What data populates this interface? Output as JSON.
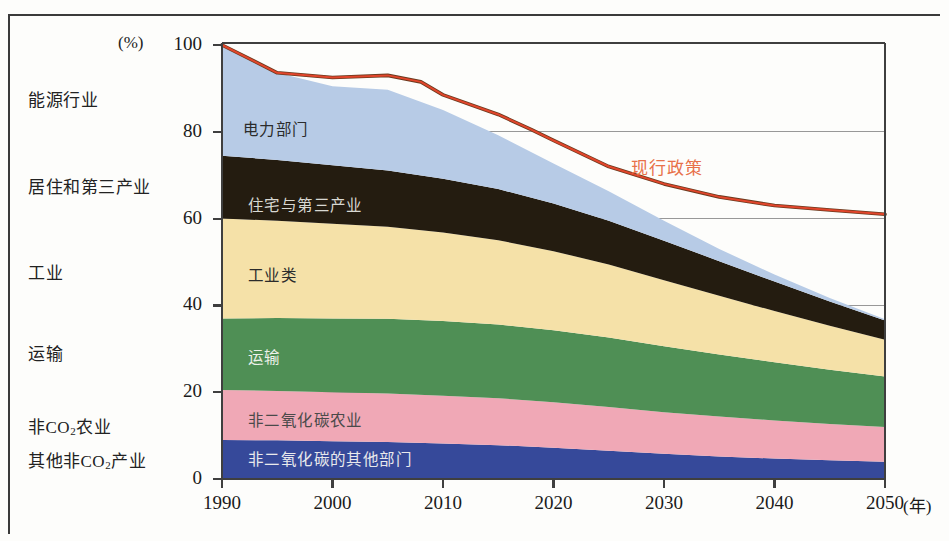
{
  "axis": {
    "y_unit": "(%)",
    "y_ticks": [
      0,
      20,
      40,
      60,
      80,
      100
    ],
    "x_ticks": [
      1990,
      2000,
      2010,
      2020,
      2030,
      2040,
      2050
    ],
    "x_unit": "(年)"
  },
  "side_labels": [
    {
      "text": "能源行业",
      "y": 97
    },
    {
      "text": "居住和第三产业",
      "y": 184
    },
    {
      "text": "工业",
      "y": 270
    },
    {
      "text": "运输",
      "y": 351
    },
    {
      "text": "非CO2农业",
      "y": 424,
      "sub": "2",
      "pre": "非CO",
      "post": "农业"
    },
    {
      "text": "其他非CO2产业",
      "y": 458,
      "sub": "2",
      "pre": "其他非CO",
      "post": "产业"
    }
  ],
  "series_labels": [
    {
      "key": "power",
      "text": "电力部门",
      "color": "#2b2b2b",
      "x": 243,
      "y": 127
    },
    {
      "key": "residential",
      "text": "住宅与第三产业",
      "color": "#d8d8d2",
      "x": 248,
      "y": 203
    },
    {
      "key": "industry",
      "text": "工业类",
      "color": "#2b2b2b",
      "x": 248,
      "y": 273
    },
    {
      "key": "transport",
      "text": "运输",
      "color": "#eef1ea",
      "x": 248,
      "y": 355
    },
    {
      "key": "agri",
      "text": "非二氧化碳农业",
      "color": "#4a4a4a",
      "x": 248,
      "y": 418
    },
    {
      "key": "other",
      "text": "非二氧化碳的其他部门",
      "color": "#e9e9ec",
      "x": 248,
      "y": 457
    }
  ],
  "annotation": {
    "policy_line_label": "现行政策",
    "color": "#e8714a"
  },
  "colors": {
    "power": "#b7cbe6",
    "residential": "#241c10",
    "industry": "#f5e1a8",
    "transport": "#4f8f55",
    "agri": "#f0a8b6",
    "other": "#36499a",
    "policy_line": "#e1452b",
    "policy_line_dark": "#6b3a1e",
    "axis": "#4a4a4a",
    "gridline": "#8d8d8d"
  },
  "chart_data": {
    "type": "area",
    "title": "",
    "xlabel": "(年)",
    "ylabel": "(%)",
    "xlim": [
      1990,
      2050
    ],
    "ylim": [
      0,
      100
    ],
    "grid": true,
    "legend": "left-side category labels",
    "stacking": "stacked-area (cumulative bottom to top)",
    "x": [
      1990,
      1995,
      2000,
      2005,
      2010,
      2015,
      2020,
      2025,
      2030,
      2035,
      2040,
      2045,
      2050
    ],
    "series": [
      {
        "name": "其他非CO2产业",
        "label_cn": "非二氧化碳的其他部门",
        "color": "#36499a",
        "values": [
          9.0,
          8.9,
          8.7,
          8.5,
          8.2,
          7.8,
          7.2,
          6.5,
          5.8,
          5.2,
          4.7,
          4.3,
          4.0
        ]
      },
      {
        "name": "非CO2农业",
        "label_cn": "非二氧化碳农业",
        "color": "#f0a8b6",
        "values": [
          11.5,
          11.4,
          11.3,
          11.2,
          11.0,
          10.8,
          10.5,
          10.1,
          9.6,
          9.2,
          8.8,
          8.4,
          8.0
        ]
      },
      {
        "name": "运输",
        "label_cn": "运输",
        "color": "#4f8f55",
        "values": [
          16.5,
          16.8,
          17.0,
          17.2,
          17.2,
          17.0,
          16.6,
          16.0,
          15.2,
          14.3,
          13.4,
          12.5,
          11.6
        ]
      },
      {
        "name": "工业",
        "label_cn": "工业类",
        "color": "#f5e1a8",
        "values": [
          23.0,
          22.4,
          21.8,
          21.2,
          20.4,
          19.4,
          18.2,
          16.8,
          15.2,
          13.5,
          11.8,
          10.1,
          8.5
        ]
      },
      {
        "name": "居住和第三产业",
        "label_cn": "住宅与第三产业",
        "color": "#241c10",
        "values": [
          14.5,
          14.0,
          13.5,
          13.0,
          12.4,
          11.8,
          11.0,
          10.1,
          9.1,
          8.0,
          6.8,
          5.6,
          4.4
        ]
      },
      {
        "name": "能源行业",
        "label_cn": "电力部门",
        "color": "#b7cbe6",
        "values": [
          25.5,
          20.1,
          18.2,
          18.6,
          15.8,
          12.4,
          9.2,
          6.8,
          4.6,
          2.8,
          1.6,
          0.8,
          0.3
        ]
      }
    ],
    "cumulative_top": [
      100.0,
      93.6,
      90.5,
      89.7,
      85.0,
      79.2,
      72.7,
      66.3,
      59.5,
      53.0,
      47.1,
      41.7,
      36.8
    ],
    "reference_line": {
      "name": "现行政策",
      "color": "#e1452b",
      "style": "solid-red-over-dark",
      "x": [
        1990,
        1995,
        2000,
        2005,
        2008,
        2010,
        2015,
        2018,
        2020,
        2025,
        2030,
        2035,
        2040,
        2045,
        2050
      ],
      "y": [
        100.0,
        93.6,
        92.5,
        93.0,
        91.5,
        88.5,
        84.0,
        80.5,
        78.0,
        72.0,
        68.0,
        65.0,
        63.0,
        62.0,
        61.0
      ]
    }
  }
}
